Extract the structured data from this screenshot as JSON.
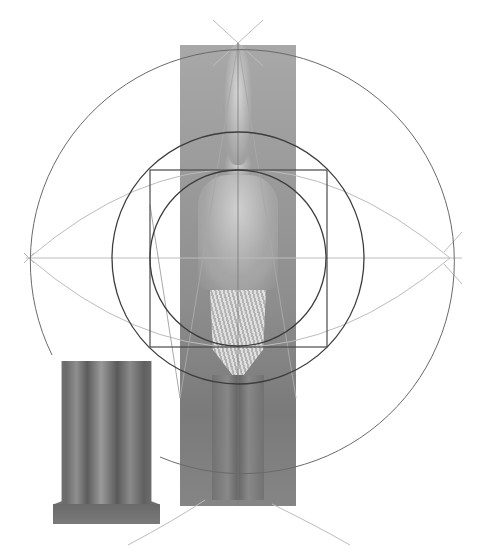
{
  "figure": {
    "title": "",
    "main_statue": {
      "label": "standing-king-statue"
    },
    "inset_statue": {
      "label": "triad-statue-group"
    }
  },
  "geometry": {
    "center": [
      238,
      258
    ],
    "circles": [
      {
        "name": "outer-circle",
        "r": 212,
        "color": "#6a6a6a"
      },
      {
        "name": "middle-circle",
        "r": 126,
        "color": "#3c3c3c"
      },
      {
        "name": "inner-circle",
        "r": 88,
        "color": "#3c3c3c"
      }
    ],
    "square": {
      "x": 150,
      "y": 170,
      "size": 177,
      "color": "#4a4a4a"
    },
    "axis_color": "#bdbdbd",
    "construction_color": "#b8b8b8"
  }
}
